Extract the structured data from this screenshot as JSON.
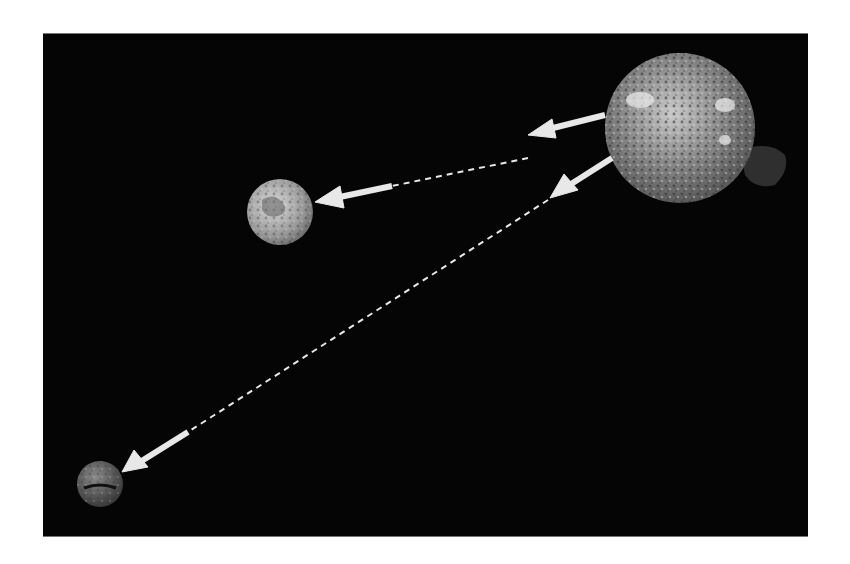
{
  "diagram": {
    "type": "solar-emission-to-planets",
    "background": "#050505",
    "nodes": [
      {
        "id": "sun",
        "label": "",
        "cx": 680,
        "cy": 128,
        "r": 75
      },
      {
        "id": "earth",
        "label": "",
        "cx": 280,
        "cy": 212,
        "r": 33
      },
      {
        "id": "mars",
        "label": "",
        "cx": 100,
        "cy": 484,
        "r": 23
      }
    ],
    "edges": [
      {
        "from": "sun",
        "to": "earth",
        "style": "solid-arrow-then-dashed-then-solid-arrow"
      },
      {
        "from": "sun",
        "to": "mars",
        "style": "solid-arrow-then-dashed-then-solid-arrow"
      }
    ],
    "arrow_color": "#e8e8e8"
  }
}
